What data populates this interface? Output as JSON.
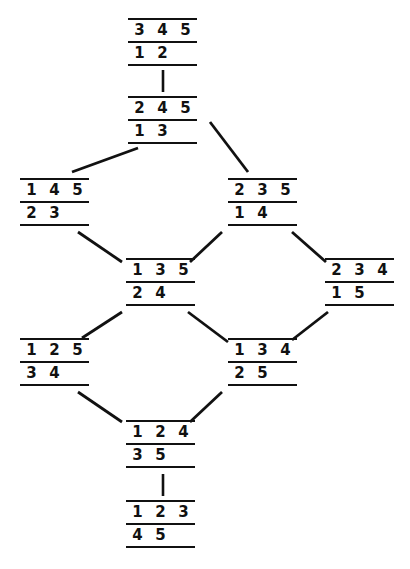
{
  "diagram": {
    "type": "hasse-diagram",
    "ink_color": "#111111",
    "background_color": "#ffffff",
    "nodes": [
      {
        "id": "n1",
        "label": "345/12",
        "rows": [
          [
            "3",
            "4",
            "5"
          ],
          [
            "1",
            "2"
          ]
        ],
        "x": 128,
        "y": 18
      },
      {
        "id": "n2",
        "label": "245/13",
        "rows": [
          [
            "2",
            "4",
            "5"
          ],
          [
            "1",
            "3"
          ]
        ],
        "x": 128,
        "y": 96
      },
      {
        "id": "n3",
        "label": "145/23",
        "rows": [
          [
            "1",
            "4",
            "5"
          ],
          [
            "2",
            "3"
          ]
        ],
        "x": 20,
        "y": 178
      },
      {
        "id": "n4",
        "label": "235/14",
        "rows": [
          [
            "2",
            "3",
            "5"
          ],
          [
            "1",
            "4"
          ]
        ],
        "x": 228,
        "y": 178
      },
      {
        "id": "n5",
        "label": "135/24",
        "rows": [
          [
            "1",
            "3",
            "5"
          ],
          [
            "2",
            "4"
          ]
        ],
        "x": 126,
        "y": 258
      },
      {
        "id": "n6",
        "label": "234/15",
        "rows": [
          [
            "2",
            "3",
            "4"
          ],
          [
            "1",
            "5"
          ]
        ],
        "x": 325,
        "y": 258
      },
      {
        "id": "n7",
        "label": "125/34",
        "rows": [
          [
            "1",
            "2",
            "5"
          ],
          [
            "3",
            "4"
          ]
        ],
        "x": 20,
        "y": 338
      },
      {
        "id": "n8",
        "label": "134/25",
        "rows": [
          [
            "1",
            "3",
            "4"
          ],
          [
            "2",
            "5"
          ]
        ],
        "x": 228,
        "y": 338
      },
      {
        "id": "n9",
        "label": "124/35",
        "rows": [
          [
            "1",
            "2",
            "4"
          ],
          [
            "3",
            "5"
          ]
        ],
        "x": 126,
        "y": 420
      },
      {
        "id": "n10",
        "label": "123/45",
        "rows": [
          [
            "1",
            "2",
            "3"
          ],
          [
            "4",
            "5"
          ]
        ],
        "x": 126,
        "y": 500
      }
    ],
    "edges": [
      {
        "from": "n2",
        "to": "n1",
        "kind": "vertical",
        "x1": 163,
        "y1": 92,
        "x2": 163,
        "y2": 70
      },
      {
        "from": "n2",
        "to": "n3",
        "kind": "diagonal",
        "x1": 138,
        "y1": 148,
        "x2": 72,
        "y2": 172
      },
      {
        "from": "n2",
        "to": "n4",
        "kind": "diagonal",
        "x1": 210,
        "y1": 122,
        "x2": 248,
        "y2": 172
      },
      {
        "from": "n3",
        "to": "n5",
        "kind": "diagonal",
        "x1": 78,
        "y1": 232,
        "x2": 122,
        "y2": 262
      },
      {
        "from": "n4",
        "to": "n5",
        "kind": "diagonal",
        "x1": 222,
        "y1": 232,
        "x2": 190,
        "y2": 262
      },
      {
        "from": "n4",
        "to": "n6",
        "kind": "diagonal",
        "x1": 292,
        "y1": 232,
        "x2": 326,
        "y2": 262
      },
      {
        "from": "n5",
        "to": "n7",
        "kind": "diagonal",
        "x1": 122,
        "y1": 312,
        "x2": 82,
        "y2": 338
      },
      {
        "from": "n5",
        "to": "n8",
        "kind": "diagonal",
        "x1": 188,
        "y1": 312,
        "x2": 228,
        "y2": 342
      },
      {
        "from": "n6",
        "to": "n8",
        "kind": "diagonal",
        "x1": 328,
        "y1": 312,
        "x2": 292,
        "y2": 340
      },
      {
        "from": "n7",
        "to": "n9",
        "kind": "diagonal",
        "x1": 78,
        "y1": 392,
        "x2": 122,
        "y2": 422
      },
      {
        "from": "n8",
        "to": "n9",
        "kind": "diagonal",
        "x1": 222,
        "y1": 392,
        "x2": 190,
        "y2": 422
      },
      {
        "from": "n10",
        "to": "n9",
        "kind": "vertical",
        "x1": 163,
        "y1": 496,
        "x2": 163,
        "y2": 474
      }
    ]
  }
}
